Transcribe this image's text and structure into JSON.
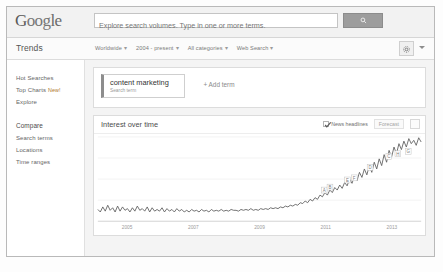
{
  "header": {
    "logo_text": "Google",
    "search": {
      "placeholder": "Explore search volumes. Type in one or more terms.",
      "value": "",
      "button_icon": "search-icon"
    }
  },
  "subheader": {
    "brand": "Trends",
    "filters": [
      {
        "label": "Worldwide",
        "caret": "▾"
      },
      {
        "label": "2004 - present",
        "caret": "▾"
      },
      {
        "label": "All categories",
        "caret": "▾"
      },
      {
        "label": "Web Search",
        "caret": "▾"
      }
    ],
    "settings_icon": "gear-icon",
    "overflow_icon": "chevron-down-icon"
  },
  "sidebar": {
    "groups": [
      {
        "items": [
          {
            "label": "Hot Searches",
            "badge": ""
          },
          {
            "label": "Top Charts",
            "badge": "New!"
          },
          {
            "label": "Explore",
            "badge": ""
          }
        ]
      },
      {
        "heading": "Compare",
        "items": [
          {
            "label": "Search terms",
            "badge": ""
          },
          {
            "label": "Locations",
            "badge": ""
          },
          {
            "label": "Time ranges",
            "badge": ""
          }
        ]
      }
    ]
  },
  "terms_panel": {
    "chip": {
      "title": "content marketing",
      "subtitle": "Search term"
    },
    "add_label": "+ Add term"
  },
  "chart_panel": {
    "title": "Interest over time",
    "news_headlines_label": "News headlines",
    "news_headlines_checked": true,
    "forecast_label": "Forecast",
    "embed_icon": "embed-icon"
  },
  "chart_data": {
    "type": "line",
    "title": "Interest over time",
    "xlabel": "",
    "ylabel": "",
    "ylim": [
      0,
      100
    ],
    "grid": true,
    "legend": "none",
    "xtick_labels": [
      "2005",
      "2007",
      "2009",
      "2011",
      "2013"
    ],
    "xtick_positions": [
      0.1,
      0.3,
      0.5,
      0.7,
      0.9
    ],
    "series": [
      {
        "name": "content marketing",
        "color": "#5f5f5f",
        "values": [
          14,
          11,
          17,
          12,
          19,
          13,
          16,
          11,
          18,
          12,
          17,
          13,
          15,
          11,
          16,
          12,
          18,
          13,
          15,
          12,
          17,
          11,
          16,
          12,
          14,
          12,
          16,
          11,
          15,
          12,
          14,
          11,
          15,
          12,
          14,
          11,
          13,
          11,
          14,
          12,
          13,
          11,
          14,
          12,
          13,
          11,
          14,
          12,
          13,
          12,
          14,
          12,
          13,
          12,
          14,
          13,
          13,
          12,
          14,
          13,
          14,
          13,
          15,
          13,
          14,
          13,
          15,
          14,
          15,
          14,
          16,
          15,
          16,
          15,
          17,
          16,
          18,
          17,
          19,
          18,
          20,
          19,
          22,
          21,
          24,
          22,
          26,
          24,
          28,
          26,
          31,
          29,
          34,
          31,
          37,
          34,
          40,
          37,
          43,
          39,
          46,
          42,
          50,
          45,
          54,
          48,
          58,
          52,
          62,
          55,
          66,
          58,
          70,
          62,
          74,
          66,
          79,
          70,
          84,
          76,
          88,
          80,
          92,
          85,
          95,
          88,
          98,
          92,
          96,
          90,
          99,
          94
        ]
      }
    ],
    "news_markers": [
      {
        "letter": "A",
        "x": 0.7,
        "y": 0.3
      },
      {
        "letter": "B",
        "x": 0.718,
        "y": 0.335
      },
      {
        "letter": "E",
        "x": 0.772,
        "y": 0.42
      },
      {
        "letter": "F",
        "x": 0.793,
        "y": 0.445
      },
      {
        "letter": "D",
        "x": 0.842,
        "y": 0.57
      },
      {
        "letter": "C",
        "x": 0.9,
        "y": 0.7
      },
      {
        "letter": "H",
        "x": 0.928,
        "y": 0.73
      },
      {
        "letter": "G",
        "x": 0.96,
        "y": 0.76
      }
    ]
  }
}
